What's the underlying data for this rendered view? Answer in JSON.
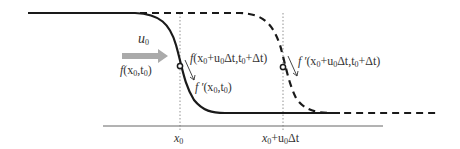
{
  "diagram": {
    "velocity_label": "u",
    "velocity_sub": "0",
    "labels": {
      "f_x0_t0": {
        "f": "f",
        "args": "(x",
        "s1": "0",
        "mid": ",t",
        "s2": "0",
        "end": ")"
      },
      "f_shift": {
        "f": "f",
        "args": "(x",
        "s1": "0",
        "plus": "+u",
        "s2": "0",
        "dt": "Δt,t",
        "s3": "0",
        "end": "+Δt)"
      },
      "fprime_x0_t0": {
        "f": "f ′",
        "args": "(x",
        "s1": "0",
        "mid": ",t",
        "s2": "0",
        "end": ")"
      },
      "fprime_shift": {
        "f": "f ′",
        "args": "(x",
        "s1": "0",
        "plus": "+u",
        "s2": "0",
        "dt": "Δt,t",
        "s3": "0",
        "end": "+Δt)"
      }
    },
    "axis_ticks": {
      "x0": {
        "x": "x",
        "sub": "0"
      },
      "x0_shift": {
        "x": "x",
        "sub": "0",
        "plus": "+u",
        "sub2": "0",
        "dt": "Δt"
      }
    },
    "colors": {
      "curve": "#1a1a1a",
      "arrow": "#aaaaaa",
      "axis": "#555555",
      "guide": "#777777"
    }
  }
}
